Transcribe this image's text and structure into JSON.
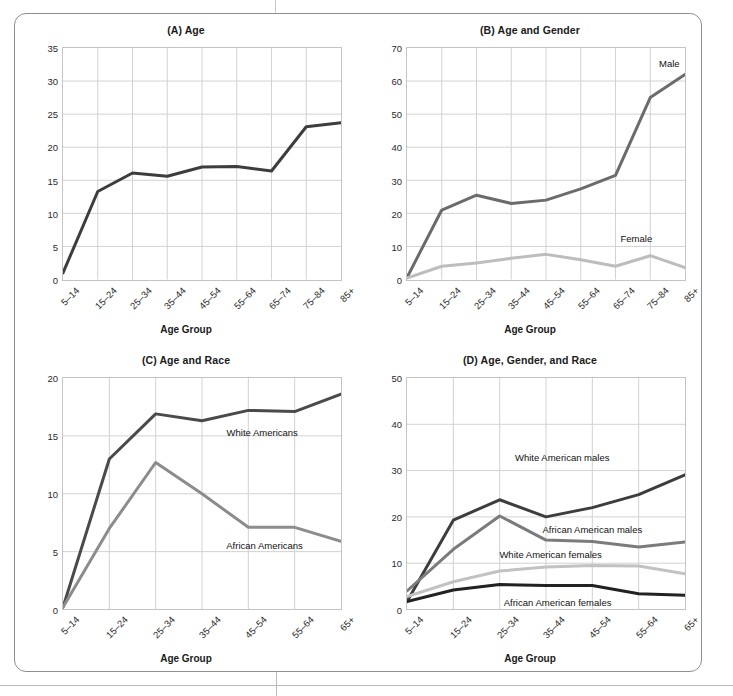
{
  "figure": {
    "axis_ylabel": "Suicides per 100,000 Population",
    "axis_xlabel": "Age Group"
  },
  "chart_data": [
    {
      "id": "A",
      "type": "line",
      "title": "(A) Age",
      "xlabel": "Age Group",
      "ylabel": "Suicides per 100,000 Population",
      "categories": [
        "5–14",
        "15–24",
        "25–34",
        "35–44",
        "45–54",
        "55–64",
        "65–74",
        "75–84",
        "85+"
      ],
      "ylim": [
        0,
        35
      ],
      "yticks": [
        0,
        5,
        10,
        15,
        20,
        25,
        30,
        35
      ],
      "grid": true,
      "legend_position": "none",
      "series": [
        {
          "name": "All",
          "color": "#3d3d3d",
          "values": [
            1.0,
            13.3,
            16.1,
            15.6,
            17.0,
            17.1,
            16.4,
            23.1,
            23.7
          ]
        }
      ]
    },
    {
      "id": "B",
      "type": "line",
      "title": "(B) Age and Gender",
      "xlabel": "Age Group",
      "ylabel": "Suicides per 100,000 Population",
      "categories": [
        "5–14",
        "15–24",
        "25–34",
        "35–44",
        "45–54",
        "55–64",
        "65–74",
        "75–84",
        "85+"
      ],
      "ylim": [
        0,
        70
      ],
      "yticks": [
        0,
        10,
        20,
        30,
        40,
        50,
        60,
        70
      ],
      "grid": true,
      "legend_position": "inline",
      "series": [
        {
          "name": "Male",
          "color": "#6b6b6b",
          "values": [
            0.6,
            21.0,
            25.5,
            23.0,
            24.0,
            27.4,
            31.5,
            55.0,
            62.0
          ],
          "label": "Male",
          "label_x": 7.55,
          "label_y": 65.5
        },
        {
          "name": "Female",
          "color": "#bdbdbd",
          "values": [
            0.4,
            4.0,
            5.0,
            6.4,
            7.6,
            6.0,
            4.0,
            7.2,
            3.6
          ],
          "label": "Female",
          "label_x": 6.6,
          "label_y": 12.6
        }
      ]
    },
    {
      "id": "C",
      "type": "line",
      "title": "(C) Age and Race",
      "xlabel": "Age Group",
      "ylabel": "Suicides per 100,000 Population",
      "categories": [
        "5–14",
        "15–24",
        "25–34",
        "35–44",
        "45–54",
        "55–64",
        "65+"
      ],
      "ylim": [
        0,
        20
      ],
      "yticks": [
        0,
        5,
        10,
        15,
        20
      ],
      "grid": true,
      "legend_position": "inline",
      "series": [
        {
          "name": "White Americans",
          "color": "#4a4a4a",
          "values": [
            0.2,
            13.0,
            16.9,
            16.3,
            17.2,
            17.1,
            18.6
          ],
          "label": "White Americans",
          "label_x": 4.3,
          "label_y": 15.3
        },
        {
          "name": "African Americans",
          "color": "#8c8c8c",
          "values": [
            0.2,
            7.0,
            12.7,
            10.0,
            7.1,
            7.1,
            5.9
          ],
          "label": "African Americans",
          "label_x": 4.35,
          "label_y": 5.6
        }
      ]
    },
    {
      "id": "D",
      "type": "line",
      "title": "(D) Age, Gender, and Race",
      "xlabel": "Age Group",
      "ylabel": "Suicides per 100,000 Population",
      "categories": [
        "5–14",
        "15–24",
        "25–34",
        "35–44",
        "45–54",
        "55–64",
        "65+"
      ],
      "ylim": [
        0,
        50
      ],
      "yticks": [
        0,
        10,
        20,
        30,
        40,
        50
      ],
      "grid": true,
      "legend_position": "inline",
      "series": [
        {
          "name": "White American males",
          "color": "#3d3d3d",
          "values": [
            1.7,
            19.3,
            23.7,
            20.0,
            22.0,
            24.8,
            29.1
          ],
          "label": "White American males",
          "label_x": 3.35,
          "label_y": 32.8
        },
        {
          "name": "African American males",
          "color": "#7b7b7b",
          "values": [
            4.0,
            13.0,
            20.2,
            15.0,
            14.7,
            13.5,
            14.6
          ],
          "label": "African American males",
          "label_x": 4.0,
          "label_y": 17.4
        },
        {
          "name": "White American females",
          "color": "#c2c2c2",
          "values": [
            2.8,
            6.0,
            8.3,
            9.2,
            9.5,
            9.4,
            7.7
          ],
          "label": "White American females",
          "label_x": 3.1,
          "label_y": 12.0
        },
        {
          "name": "African American females",
          "color": "#222222",
          "values": [
            1.7,
            4.2,
            5.4,
            5.2,
            5.2,
            3.4,
            3.1
          ],
          "label": "African American females",
          "label_x": 3.25,
          "label_y": 1.7
        }
      ]
    }
  ]
}
